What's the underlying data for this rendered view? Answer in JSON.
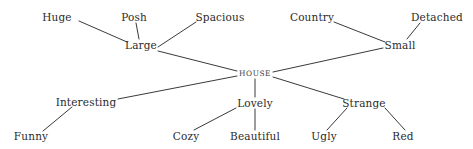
{
  "diagram": {
    "type": "semantic-network",
    "background_color": "#ffffff",
    "line_color": "#3a3a3a",
    "text_color": "#2b2b2b",
    "width": 473,
    "height": 149,
    "nodes": [
      {
        "id": "huge",
        "label": "Huge",
        "x": 57,
        "y": 17,
        "role": "leaf"
      },
      {
        "id": "posh",
        "label": "Posh",
        "x": 134,
        "y": 17,
        "role": "leaf"
      },
      {
        "id": "spacious",
        "label": "Spacious",
        "x": 220,
        "y": 17,
        "role": "leaf"
      },
      {
        "id": "country",
        "label": "Country",
        "x": 312,
        "y": 17,
        "role": "leaf"
      },
      {
        "id": "detached",
        "label": "Detached",
        "x": 437,
        "y": 17,
        "role": "leaf"
      },
      {
        "id": "large",
        "label": "Large",
        "x": 141,
        "y": 45,
        "role": "branch"
      },
      {
        "id": "small",
        "label": "Small",
        "x": 400,
        "y": 45,
        "role": "branch"
      },
      {
        "id": "house",
        "label": "HOUSE",
        "x": 255,
        "y": 73,
        "role": "root"
      },
      {
        "id": "interesting",
        "label": "Interesting",
        "x": 86,
        "y": 102,
        "role": "branch"
      },
      {
        "id": "lovely",
        "label": "Lovely",
        "x": 255,
        "y": 103,
        "role": "branch"
      },
      {
        "id": "strange",
        "label": "Strange",
        "x": 364,
        "y": 103,
        "role": "branch"
      },
      {
        "id": "funny",
        "label": "Funny",
        "x": 31,
        "y": 136,
        "role": "leaf"
      },
      {
        "id": "cozy",
        "label": "Cozy",
        "x": 186,
        "y": 136,
        "role": "leaf"
      },
      {
        "id": "beautiful",
        "label": "Beautiful",
        "x": 255,
        "y": 136,
        "role": "leaf"
      },
      {
        "id": "ugly",
        "label": "Ugly",
        "x": 324,
        "y": 136,
        "role": "leaf"
      },
      {
        "id": "red",
        "label": "Red",
        "x": 403,
        "y": 136,
        "role": "leaf"
      }
    ],
    "edges": [
      {
        "from": "huge",
        "to": "large",
        "x1": 79,
        "y1": 21,
        "x2": 127,
        "y2": 42
      },
      {
        "from": "posh",
        "to": "large",
        "x1": 136,
        "y1": 23,
        "x2": 139,
        "y2": 39
      },
      {
        "from": "large",
        "to": "spacious",
        "x1": 158,
        "y1": 47,
        "x2": 196,
        "y2": 22
      },
      {
        "from": "large",
        "to": "house",
        "x1": 158,
        "y1": 51,
        "x2": 237,
        "y2": 71
      },
      {
        "from": "country",
        "to": "small",
        "x1": 334,
        "y1": 22,
        "x2": 385,
        "y2": 42
      },
      {
        "from": "detached",
        "to": "small",
        "x1": 420,
        "y1": 23,
        "x2": 407,
        "y2": 39
      },
      {
        "from": "house",
        "to": "small",
        "x1": 273,
        "y1": 72,
        "x2": 383,
        "y2": 48
      },
      {
        "from": "house",
        "to": "interesting",
        "x1": 237,
        "y1": 76,
        "x2": 118,
        "y2": 99
      },
      {
        "from": "house",
        "to": "lovely",
        "x1": 255,
        "y1": 79,
        "x2": 255,
        "y2": 97
      },
      {
        "from": "house",
        "to": "strange",
        "x1": 273,
        "y1": 77,
        "x2": 344,
        "y2": 99
      },
      {
        "from": "interesting",
        "to": "funny",
        "x1": 72,
        "y1": 107,
        "x2": 43,
        "y2": 131
      },
      {
        "from": "cozy",
        "to": "lovely",
        "x1": 194,
        "y1": 130,
        "x2": 236,
        "y2": 108
      },
      {
        "from": "lovely",
        "to": "beautiful",
        "x1": 255,
        "y1": 109,
        "x2": 255,
        "y2": 130
      },
      {
        "from": "strange",
        "to": "ugly",
        "x1": 347,
        "y1": 108,
        "x2": 327,
        "y2": 130
      },
      {
        "from": "strange",
        "to": "red",
        "x1": 385,
        "y1": 108,
        "x2": 405,
        "y2": 130
      }
    ]
  }
}
